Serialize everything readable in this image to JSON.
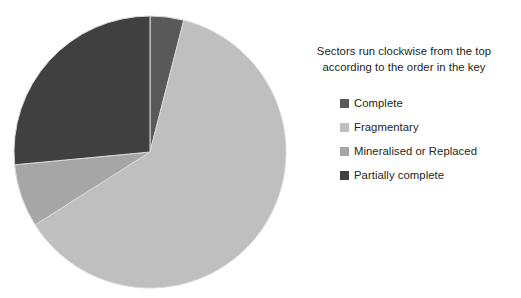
{
  "chart_data": {
    "type": "pie",
    "title": "",
    "note_lines": [
      "Sectors run clockwise from the top",
      "according to the order in the key"
    ],
    "legend_position": "right",
    "start_angle_deg": 0,
    "direction": "clockwise",
    "center": {
      "x": 150,
      "y": 152
    },
    "radius": 136,
    "categories": [
      "Complete",
      "Fragmentary",
      "Mineralised or Replaced",
      "Partially complete"
    ],
    "values": [
      4,
      62,
      7.5,
      26.5
    ],
    "units": "percent",
    "colors": [
      "#595959",
      "#bfbfbf",
      "#a6a6a6",
      "#404040"
    ],
    "slices": [
      {
        "label": "Complete",
        "value": 4,
        "color": "#595959",
        "start_deg": 0,
        "end_deg": 14.4
      },
      {
        "label": "Fragmentary",
        "value": 62,
        "color": "#bfbfbf",
        "start_deg": 14.4,
        "end_deg": 237.6
      },
      {
        "label": "Mineralised or Replaced",
        "value": 7.5,
        "color": "#a6a6a6",
        "start_deg": 237.6,
        "end_deg": 264.6
      },
      {
        "label": "Partially complete",
        "value": 26.5,
        "color": "#404040",
        "start_deg": 264.6,
        "end_deg": 360
      }
    ],
    "stroke_color": "#d9d9d9",
    "background": "#ffffff"
  },
  "legend": {
    "items": [
      {
        "label": "Complete",
        "color": "#595959"
      },
      {
        "label": "Fragmentary",
        "color": "#bfbfbf"
      },
      {
        "label": "Mineralised or Replaced",
        "color": "#a6a6a6"
      },
      {
        "label": "Partially complete",
        "color": "#404040"
      }
    ]
  }
}
